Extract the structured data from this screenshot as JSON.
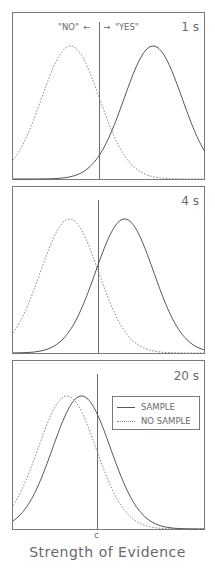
{
  "chart_data": [
    {
      "type": "line",
      "panel_label": "1 s",
      "title": "",
      "annotation": "\"NO\" ← | → \"YES\"",
      "annotation_no": "\"NO\" ←",
      "annotation_yes": "→ \"YES\"",
      "xlabel": "",
      "criterion_label": "",
      "series": [
        {
          "name": "NO SAMPLE",
          "style": "dashed",
          "mean": -1.0,
          "sd": 1.0
        },
        {
          "name": "SAMPLE",
          "style": "solid",
          "mean": 1.85,
          "sd": 1.0
        }
      ],
      "criterion_x": 0.0,
      "grid": false
    },
    {
      "type": "line",
      "panel_label": "4 s",
      "xlabel": "",
      "series": [
        {
          "name": "NO SAMPLE",
          "style": "dashed",
          "mean": -1.0,
          "sd": 1.0
        },
        {
          "name": "SAMPLE",
          "style": "solid",
          "mean": 0.9,
          "sd": 1.0
        }
      ],
      "criterion_x": 0.0,
      "grid": false
    },
    {
      "type": "line",
      "panel_label": "20 s",
      "xlabel": "Strength of Evidence",
      "criterion_label": "c",
      "legend": {
        "position": "upper right",
        "entries": [
          "SAMPLE",
          "NO SAMPLE"
        ]
      },
      "series": [
        {
          "name": "NO SAMPLE",
          "style": "dashed",
          "mean": -1.05,
          "sd": 1.0
        },
        {
          "name": "SAMPLE",
          "style": "solid",
          "mean": -0.55,
          "sd": 1.0
        }
      ],
      "criterion_x": 0.0,
      "grid": false
    }
  ],
  "figure": {
    "xlabel": "Strength of Evidence",
    "criterion_tick": "c",
    "legend": {
      "sample": "SAMPLE",
      "no_sample": "NO SAMPLE"
    },
    "panels": [
      {
        "label": "1 s"
      },
      {
        "label": "4 s"
      },
      {
        "label": "20 s"
      }
    ],
    "response_no": "\"NO\"",
    "response_yes": "\"YES\"",
    "arrow_left": "←",
    "arrow_right": "→"
  }
}
